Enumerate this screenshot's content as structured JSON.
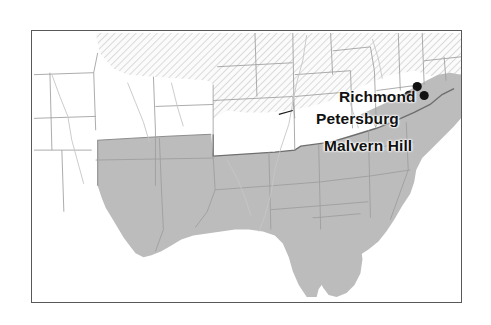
{
  "map": {
    "title": "Confederate States Map with Virginia Battle Sites",
    "frame": {
      "border_color": "#585858"
    },
    "legend_regions": [
      {
        "name": "confederate-states",
        "fill": "#bcbcbc",
        "pattern": "solid-gray"
      },
      {
        "name": "union-states",
        "fill": "#f2f2f2",
        "pattern": "diagonal-hatch"
      },
      {
        "name": "western-territories",
        "fill": "#ffffff",
        "pattern": "none"
      }
    ],
    "colors": {
      "confederate_fill": "#bcbcbc",
      "union_fill": "#f4f4f4",
      "hatch_line": "#c9c9c9",
      "state_border": "#9a9a9a",
      "region_border": "#6e6e6e",
      "coastline": "#b9b9b9",
      "marker": "#111111",
      "label_text": "#111111",
      "frame_border": "#585858",
      "background": "#ffffff"
    },
    "markers": [
      {
        "name": "richmond-marker",
        "label": "Richmond",
        "x": 387,
        "y": 56,
        "r": 4.6
      },
      {
        "name": "petersburg-marker",
        "label": "Petersburg",
        "x": 379,
        "y": 65,
        "r": 4.8
      },
      {
        "name": "malvern-hill-marker",
        "label": "Malvern Hill",
        "x": 394,
        "y": 65,
        "r": 4.6
      }
    ],
    "labels": [
      {
        "name": "richmond-label",
        "text": "Richmond"
      },
      {
        "name": "petersburg-label",
        "text": "Petersburg"
      },
      {
        "name": "malvern-hill-label",
        "text": "Malvern Hill"
      }
    ],
    "leader_lines": [
      {
        "name": "petersburg-leader",
        "x1": 344,
        "y1": 65,
        "x2": 374,
        "y2": 65
      },
      {
        "name": "malvern-hill-leader",
        "x1": 252,
        "y1": 83,
        "x2": 262,
        "y2": 80
      },
      {
        "name": "richmond-leader",
        "x1": 383,
        "y1": 60,
        "x2": 387,
        "y2": 57
      }
    ]
  }
}
